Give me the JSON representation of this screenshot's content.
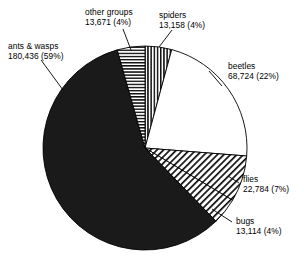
{
  "chart_data": {
    "type": "pie",
    "title": "",
    "xlabel": "",
    "ylabel": "",
    "legend_position": "callout-labels",
    "grid": false,
    "total": 311887,
    "categories": [
      "spiders",
      "beetles",
      "flies",
      "bugs",
      "ants & wasps",
      "other groups"
    ],
    "values": [
      13158,
      68724,
      22784,
      13114,
      180436,
      13671
    ],
    "percentages": [
      4,
      22,
      7,
      4,
      59,
      4
    ],
    "slices": [
      {
        "name": "spiders",
        "label": "spiders",
        "value": 13158,
        "value_text": "13,158",
        "percent": 4,
        "percent_text": "(4%)",
        "start_angle": 0,
        "end_angle": 15.2,
        "fill": "vertical-lines",
        "color": "#ffffff"
      },
      {
        "name": "beetles",
        "label": "beetles",
        "value": 68724,
        "value_text": "68,724",
        "percent": 22,
        "percent_text": "(22%)",
        "start_angle": 15.2,
        "end_angle": 94.5,
        "fill": "solid-white",
        "color": "#ffffff"
      },
      {
        "name": "flies",
        "label": "flies",
        "value": 22784,
        "value_text": "22,784",
        "percent": 7,
        "percent_text": "(7%)",
        "start_angle": 94.5,
        "end_angle": 120.8,
        "fill": "diagonal-hatch",
        "color": "#ffffff"
      },
      {
        "name": "bugs",
        "label": "bugs",
        "value": 13114,
        "value_text": "13,114",
        "percent": 4,
        "percent_text": "(4%)",
        "start_angle": 120.8,
        "end_angle": 135.9,
        "fill": "diagonal-hatch",
        "color": "#ffffff"
      },
      {
        "name": "ants-and-wasps",
        "label": "ants & wasps",
        "value": 180436,
        "value_text": "180,436",
        "percent": 59,
        "percent_text": "(59%)",
        "start_angle": 135.9,
        "end_angle": 344.2,
        "fill": "solid-black",
        "color": "#1a1a1a"
      },
      {
        "name": "other-groups",
        "label": "other groups",
        "value": 13671,
        "value_text": "13,671",
        "percent": 4,
        "percent_text": "(4%)",
        "start_angle": 344.2,
        "end_angle": 360,
        "fill": "horizontal-lines",
        "color": "#ffffff"
      }
    ]
  },
  "labels": {
    "ants_wasps": {
      "line1": "ants & wasps",
      "line2": "180,436 (59%)"
    },
    "other_groups": {
      "line1": "other groups",
      "line2": "13,671 (4%)"
    },
    "spiders": {
      "line1": "spiders",
      "line2": "13,158 (4%)"
    },
    "beetles": {
      "line1": "beetles",
      "line2": "68,724 (22%)"
    },
    "flies": {
      "line1": "flies",
      "line2": "22,784 (7%)"
    },
    "bugs": {
      "line1": "bugs",
      "line2": "13,114 (4%)"
    }
  },
  "style": {
    "stroke": "#000000",
    "background": "#ffffff",
    "dark_slice": "#1a1a1a"
  }
}
